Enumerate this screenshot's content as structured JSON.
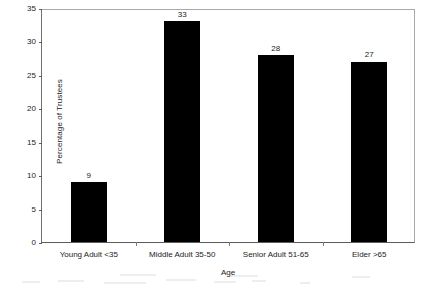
{
  "chart_data": {
    "type": "bar",
    "title": "",
    "xlabel": "Age",
    "ylabel": "Percentage of Trustees",
    "categories": [
      "Young Adult <35",
      "Middle Adult 35-50",
      "Senior Adult 51-65",
      "Elder >65"
    ],
    "values": [
      9,
      33,
      28,
      27
    ],
    "value_labels": [
      "9",
      "33",
      "28",
      "27"
    ],
    "ylim": [
      0,
      35
    ],
    "ytick_labels": [
      "0",
      "5",
      "10",
      "15",
      "20",
      "25",
      "30",
      "35"
    ],
    "ytick_values": [
      0,
      5,
      10,
      15,
      20,
      25,
      30,
      35
    ],
    "grid": false,
    "legend": false,
    "bar_color": "#000000",
    "axis_color": "#5c5c5c",
    "background_color": "#ffffff"
  }
}
